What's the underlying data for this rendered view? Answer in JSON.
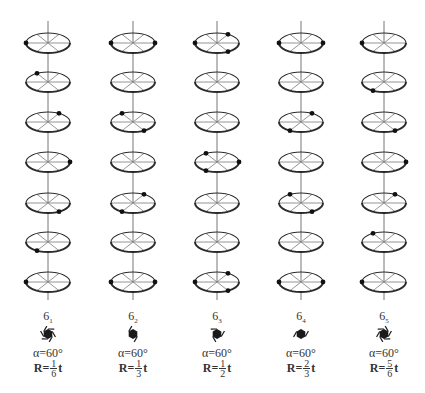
{
  "figure": {
    "rows": 7,
    "columns": [
      {
        "id": "6_1",
        "axis_base": "6",
        "axis_sub": "1",
        "alpha": "α=60°",
        "r_prefix": "R=",
        "r_num": "1",
        "r_den": "6",
        "r_suffix": "t",
        "atoms_by_row": [
          [
            180
          ],
          [
            120
          ],
          [
            60
          ],
          [
            0
          ],
          [
            300
          ],
          [
            240
          ],
          [
            180
          ]
        ]
      },
      {
        "id": "6_2",
        "axis_base": "6",
        "axis_sub": "2",
        "alpha": "α=60°",
        "r_prefix": "R=",
        "r_num": "1",
        "r_den": "3",
        "r_suffix": "t",
        "atoms_by_row": [
          [
            0,
            180
          ],
          [],
          [
            120,
            300
          ],
          [],
          [
            60,
            240
          ],
          [],
          [
            0,
            180
          ]
        ]
      },
      {
        "id": "6_3",
        "axis_base": "6",
        "axis_sub": "3",
        "alpha": "α=60°",
        "r_prefix": "R=",
        "r_num": "1",
        "r_den": "2",
        "r_suffix": "t",
        "atoms_by_row": [
          [
            60,
            180,
            300
          ],
          [],
          [],
          [
            0,
            120,
            240
          ],
          [],
          [],
          [
            60,
            180,
            300
          ]
        ]
      },
      {
        "id": "6_4",
        "axis_base": "6",
        "axis_sub": "4",
        "alpha": "α=60°",
        "r_prefix": "R=",
        "r_num": "2",
        "r_den": "3",
        "r_suffix": "t",
        "atoms_by_row": [
          [
            0,
            180
          ],
          [],
          [
            60,
            240
          ],
          [],
          [
            120,
            300
          ],
          [],
          [
            0,
            180
          ]
        ]
      },
      {
        "id": "6_5",
        "axis_base": "6",
        "axis_sub": "5",
        "alpha": "α=60°",
        "r_prefix": "R=",
        "r_num": "5",
        "r_den": "6",
        "r_suffix": "t",
        "atoms_by_row": [
          [
            180
          ],
          [
            240
          ],
          [
            300
          ],
          [
            0
          ],
          [
            60
          ],
          [
            120
          ],
          [
            180
          ]
        ]
      }
    ],
    "colors": {
      "ellipse_stroke": "#2a2a2a",
      "spoke_stroke": "#888888",
      "axis_stroke": "#777777",
      "atom_fill": "#111111",
      "symbol_fill": "#1a1a1a"
    }
  }
}
